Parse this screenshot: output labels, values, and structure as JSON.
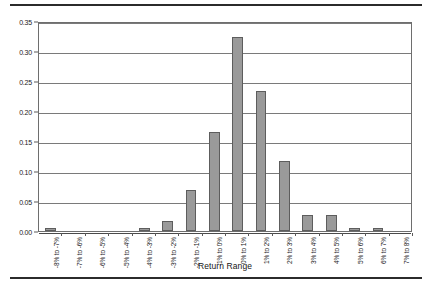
{
  "chart_data": {
    "type": "bar",
    "title": "",
    "xlabel": "Return Range",
    "ylabel": "Frequency",
    "ylim": [
      0.0,
      0.35
    ],
    "ytick_labels": [
      "0.00",
      "0.05",
      "0.10",
      "0.15",
      "0.20",
      "0.25",
      "0.30",
      "0.35"
    ],
    "ytick_values": [
      0.0,
      0.05,
      0.1,
      0.15,
      0.2,
      0.25,
      0.3,
      0.35
    ],
    "grid": true,
    "legend": false,
    "bar_color": "#9a9a9a",
    "bar_edge_color": "#5d5d5d",
    "categories": [
      "-8% to -7%",
      "-7% to -6%",
      "-6% to -5%",
      "-5% to -4%",
      "-4% to -3%",
      "-3% to -2%",
      "-2% to -1%",
      "-1% to 0%",
      "0% to 1%",
      "1% to 2%",
      "2% to 3%",
      "3% to 4%",
      "4% to 5%",
      "5% to 6%",
      "6% to 7%",
      "7% to 8%"
    ],
    "values": [
      0.005,
      0.0,
      0.0,
      0.0,
      0.005,
      0.016,
      0.069,
      0.165,
      0.323,
      0.234,
      0.117,
      0.026,
      0.026,
      0.005,
      0.005,
      0.0
    ]
  }
}
